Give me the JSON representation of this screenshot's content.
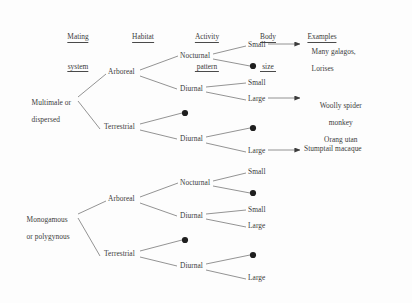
{
  "figure": {
    "type": "tree-diagram",
    "title": "",
    "background_color": "#fdfdfd",
    "ink_color": "#3b3b3b"
  },
  "headers": [
    {
      "id": "mating-system",
      "line1": "Mating",
      "line2": "system",
      "x": 78,
      "y": 14
    },
    {
      "id": "habitat",
      "line1": "Habitat",
      "line2": "",
      "x": 143,
      "y": 14
    },
    {
      "id": "activity-pattern",
      "line1": "Activity",
      "line2": "pattern",
      "x": 207,
      "y": 14
    },
    {
      "id": "body-size",
      "line1": "Body",
      "line2": "size",
      "x": 268,
      "y": 14
    },
    {
      "id": "examples",
      "line1": "Examples",
      "line2": "",
      "x": 322,
      "y": 14
    }
  ],
  "nodes": {
    "mating_systems": [
      {
        "id": "multimale-dispersed",
        "line1": "Multimale or",
        "line2": "dispersed",
        "x": 24,
        "y": 95
      },
      {
        "id": "monogamous-polygynous",
        "line1": "Monogamous",
        "line2": "or polygynous",
        "x": 19,
        "y": 212
      }
    ],
    "habitats": [
      {
        "id": "arboreal-top",
        "label": "Arboreal",
        "x": 108,
        "y": 72
      },
      {
        "id": "terrestrial-top",
        "label": "Terrestrial",
        "x": 104,
        "y": 127
      },
      {
        "id": "arboreal-bottom",
        "label": "Arboreal",
        "x": 108,
        "y": 199
      },
      {
        "id": "terrestrial-bottom",
        "label": "Terrestrial",
        "x": 104,
        "y": 254
      }
    ],
    "activity_patterns": [
      {
        "id": "nocturnal-arboreal-top",
        "label": "Nocturnal",
        "x": 180,
        "y": 57
      },
      {
        "id": "diurnal-arboreal-top",
        "label": "Diurnal",
        "x": 180,
        "y": 90
      },
      {
        "id": "suppressed-nocturnal-terrestrial-top",
        "label": "",
        "marker": "dot",
        "x": 185,
        "y": 115
      },
      {
        "id": "diurnal-terrestrial-top",
        "label": "Diurnal",
        "x": 180,
        "y": 140
      },
      {
        "id": "nocturnal-arboreal-bottom",
        "label": "Nocturnal",
        "x": 180,
        "y": 184
      },
      {
        "id": "diurnal-arboreal-bottom",
        "label": "Diurnal",
        "x": 180,
        "y": 217
      },
      {
        "id": "suppressed-nocturnal-terrestrial-bottom",
        "label": "",
        "marker": "dot",
        "x": 185,
        "y": 242
      },
      {
        "id": "diurnal-terrestrial-bottom",
        "label": "Diurnal",
        "x": 180,
        "y": 267
      }
    ],
    "body_sizes": [
      {
        "id": "small-noct-arb-top",
        "label": "Small",
        "marker": "text",
        "x": 248,
        "y": 46
      },
      {
        "id": "dot-noct-arb-top",
        "label": "",
        "marker": "dot",
        "x": 253,
        "y": 68
      },
      {
        "id": "small-diu-arb-top",
        "label": "Small",
        "marker": "text",
        "x": 248,
        "y": 84
      },
      {
        "id": "large-diu-arb-top",
        "label": "Large",
        "marker": "text",
        "x": 248,
        "y": 100
      },
      {
        "id": "dot-diu-terr-top",
        "label": "",
        "marker": "dot",
        "x": 253,
        "y": 129
      },
      {
        "id": "large-diu-terr-top",
        "label": "Large",
        "marker": "text",
        "x": 248,
        "y": 152
      },
      {
        "id": "small-noct-arb-bottom",
        "label": "Small",
        "marker": "text",
        "x": 248,
        "y": 173
      },
      {
        "id": "dot-noct-arb-bottom",
        "label": "",
        "marker": "dot",
        "x": 253,
        "y": 195
      },
      {
        "id": "small-diu-arb-bottom",
        "label": "Small",
        "marker": "text",
        "x": 248,
        "y": 211
      },
      {
        "id": "large-diu-arb-bottom",
        "label": "Large",
        "marker": "text",
        "x": 248,
        "y": 227
      },
      {
        "id": "dot-diu-terr-bottom",
        "label": "",
        "marker": "dot",
        "x": 253,
        "y": 256
      },
      {
        "id": "large-diu-terr-bottom",
        "label": "Large",
        "marker": "text",
        "x": 248,
        "y": 279
      }
    ],
    "examples": [
      {
        "id": "example-galagos-lorises",
        "line1": "Many galagos,",
        "line2": "Lorises",
        "line3": "",
        "x": 325,
        "y": 44
      },
      {
        "id": "example-woolly-spider-orangutan",
        "line1": "Woolly spider",
        "line2": "monkey",
        "line3": "Orang utan",
        "x": 325,
        "y": 98
      },
      {
        "id": "example-stumptail-macaque",
        "line1": "Stumptail macaque",
        "line2": "",
        "line3": "",
        "x": 325,
        "y": 150
      }
    ]
  }
}
